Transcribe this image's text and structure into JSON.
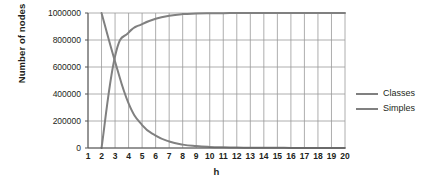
{
  "chart_data": {
    "type": "line",
    "title": "",
    "xlabel": "h",
    "ylabel": "Number of nodes",
    "xlim": [
      1,
      20
    ],
    "ylim": [
      0,
      1000000
    ],
    "grid": true,
    "legend_position": "right",
    "x": [
      1,
      2,
      3,
      4,
      5,
      6,
      7,
      8,
      9,
      10,
      11,
      12,
      13,
      14,
      15,
      16,
      17,
      18,
      19,
      20
    ],
    "xtick_labels": [
      "1",
      "2",
      "3",
      "4",
      "5",
      "6",
      "7",
      "8",
      "9",
      "10",
      "11",
      "12",
      "13",
      "14",
      "15",
      "16",
      "17",
      "18",
      "19",
      "20"
    ],
    "ytick_values": [
      0,
      200000,
      400000,
      600000,
      800000,
      1000000
    ],
    "ytick_labels": [
      "0",
      "200000",
      "400000",
      "600000",
      "800000",
      "1000000"
    ],
    "series": [
      {
        "name": "Classes",
        "color": "#808080",
        "values": [
          null,
          1000000,
          640000,
          330000,
          170000,
          92000,
          48000,
          25000,
          14000,
          8000,
          5000,
          3200,
          2100,
          1500,
          1100,
          800,
          600,
          450,
          350,
          280
        ]
      },
      {
        "name": "Simples",
        "color": "#808080",
        "values": [
          null,
          0,
          680000,
          855000,
          918000,
          957000,
          980000,
          992000,
          996000,
          998000,
          999000,
          999500,
          999700,
          999800,
          999900,
          999950,
          999970,
          999980,
          999990,
          1000000
        ]
      }
    ]
  },
  "legend": {
    "items": [
      {
        "label": "Classes",
        "color": "#808080"
      },
      {
        "label": "Simples",
        "color": "#808080"
      }
    ]
  },
  "axes": {
    "y_title": "Number of nodes",
    "x_title": "h"
  },
  "colors": {
    "grid": "#999999",
    "axis": "#555555",
    "series": "#808080",
    "text": "#231f20",
    "background": "#ffffff"
  }
}
